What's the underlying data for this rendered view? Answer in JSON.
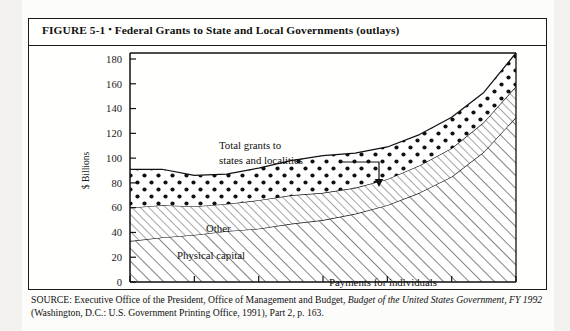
{
  "figure": {
    "number": "FIGURE 5-1",
    "bullet": "▪",
    "title": "Federal Grants to State and Local Governments (outlays)"
  },
  "source": {
    "line1_plain_a": "SOURCE: Executive Office of the President, Office of Management and Budget, ",
    "line1_italic": "Budget of the United",
    "line2_italic": "States Government, FY 1992",
    "line2_plain": " (Washington, D.C.: U.S. Government Printing Office, 1991), Part 2, p. 163."
  },
  "chart_data": {
    "type": "area",
    "title": "Federal Grants to State and Local Governments (outlays)",
    "xlabel": "",
    "ylabel": "$ Billions",
    "xlim": [
      1980,
      1992
    ],
    "ylim": [
      0,
      180
    ],
    "ytick_step": 20,
    "xtick_step": 2,
    "grid": false,
    "legend_position": "inline-annotations",
    "stacked": true,
    "x": [
      1980,
      1981,
      1982,
      1983,
      1984,
      1985,
      1986,
      1987,
      1988,
      1989,
      1990,
      1991,
      1992
    ],
    "xticks": [
      1980,
      1982,
      1984,
      1986,
      1988,
      1990,
      1992
    ],
    "xtick_labels": [
      "1980",
      "1982",
      "1984",
      "1986",
      "1988",
      "1990",
      "1992"
    ],
    "yticks": [
      0,
      20,
      40,
      60,
      80,
      100,
      120,
      140,
      160,
      180
    ],
    "ytick_labels": [
      "0",
      "20",
      "40",
      "60",
      "80",
      "100",
      "120",
      "140",
      "160",
      "180"
    ],
    "series": [
      {
        "name": "Payments for individuals",
        "pattern": "diagonal-hatch-up",
        "values": [
          33,
          36,
          38,
          41,
          43,
          47,
          50,
          55,
          62,
          72,
          85,
          105,
          133
        ]
      },
      {
        "name": "Physical capital",
        "pattern": "diagonal-hatch-thin",
        "values": [
          27,
          26,
          23,
          22,
          23,
          23,
          22,
          21,
          21,
          22,
          23,
          24,
          25
        ]
      },
      {
        "name": "Other",
        "pattern": "dots",
        "values": [
          31,
          29,
          25,
          24,
          26,
          28,
          30,
          28,
          26,
          25,
          25,
          24,
          27
        ]
      }
    ],
    "totals": {
      "name": "Total grants to states and localities",
      "values": [
        91,
        91,
        86,
        87,
        92,
        98,
        102,
        104,
        109,
        119,
        133,
        153,
        185
      ]
    },
    "annotations": [
      {
        "text": "Total grants to",
        "x_px": 190,
        "y_px": 103
      },
      {
        "text": "states and localities",
        "x_px": 190,
        "y_px": 118
      },
      {
        "text": "Other",
        "x_px": 177,
        "y_px": 186
      },
      {
        "text": "Physical capital",
        "x_px": 148,
        "y_px": 213
      },
      {
        "text": "Payments for individuals",
        "x_px": 300,
        "y_px": 240
      }
    ]
  }
}
